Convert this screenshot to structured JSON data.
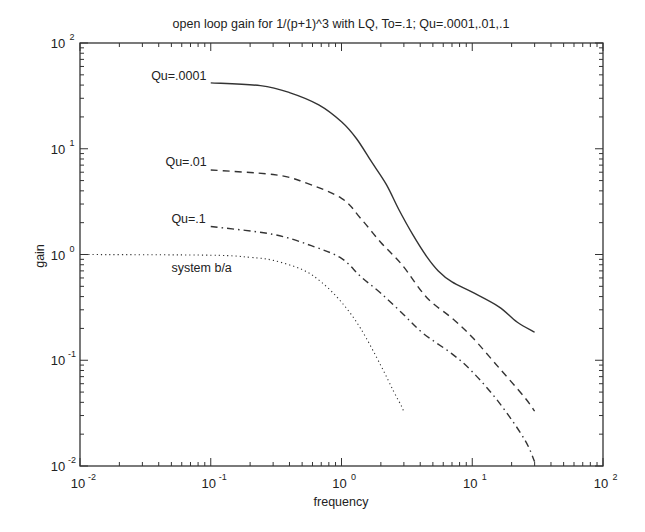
{
  "chart_data": {
    "type": "line",
    "title": "open loop gain for 1/(p+1)^3 with LQ, To=.1; Qu=.0001,.01,.1",
    "xlabel": "frequency",
    "ylabel": "gain",
    "xscale": "log",
    "yscale": "log",
    "xlim": [
      0.01,
      100
    ],
    "ylim": [
      0.01,
      100
    ],
    "grid": false,
    "x_ticks": [
      {
        "value": 0.01,
        "base": "10",
        "exp": "-2"
      },
      {
        "value": 0.1,
        "base": "10",
        "exp": "-1"
      },
      {
        "value": 1,
        "base": "10",
        "exp": "0"
      },
      {
        "value": 10,
        "base": "10",
        "exp": "1"
      },
      {
        "value": 100,
        "base": "10",
        "exp": "2"
      }
    ],
    "y_ticks": [
      {
        "value": 0.01,
        "base": "10",
        "exp": "-2"
      },
      {
        "value": 0.1,
        "base": "10",
        "exp": "-1"
      },
      {
        "value": 1,
        "base": "10",
        "exp": "0"
      },
      {
        "value": 10,
        "base": "10",
        "exp": "1"
      },
      {
        "value": 100,
        "base": "10",
        "exp": "2"
      }
    ],
    "series": [
      {
        "name": "Qu=.0001",
        "style": "solid",
        "label_at": {
          "x": 0.035,
          "y": 45
        },
        "points": [
          [
            0.1,
            42
          ],
          [
            0.24,
            39.5
          ],
          [
            0.4,
            34
          ],
          [
            0.67,
            26
          ],
          [
            1.0,
            18
          ],
          [
            1.3,
            12.5
          ],
          [
            1.7,
            7.5
          ],
          [
            2.2,
            4.6
          ],
          [
            2.75,
            2.65
          ],
          [
            3.5,
            1.55
          ],
          [
            4.5,
            0.95
          ],
          [
            5.5,
            0.7
          ],
          [
            7.0,
            0.55
          ],
          [
            10,
            0.44
          ],
          [
            16,
            0.32
          ],
          [
            22,
            0.23
          ],
          [
            30,
            0.184
          ]
        ]
      },
      {
        "name": "Qu=.01",
        "style": "dashed",
        "label_at": {
          "x": 0.045,
          "y": 6.8
        },
        "points": [
          [
            0.1,
            6.3
          ],
          [
            0.3,
            5.7
          ],
          [
            0.5,
            4.9
          ],
          [
            1.0,
            3.4
          ],
          [
            1.4,
            2.2
          ],
          [
            2.0,
            1.3
          ],
          [
            2.9,
            0.8
          ],
          [
            4.5,
            0.39
          ],
          [
            7.0,
            0.25
          ],
          [
            10,
            0.165
          ],
          [
            16,
            0.085
          ],
          [
            25,
            0.045
          ],
          [
            30,
            0.033
          ]
        ]
      },
      {
        "name": "Qu=.1",
        "style": "dashdot",
        "label_at": {
          "x": 0.05,
          "y": 2.0
        },
        "points": [
          [
            0.1,
            1.84
          ],
          [
            0.3,
            1.55
          ],
          [
            0.6,
            1.2
          ],
          [
            1.0,
            0.92
          ],
          [
            1.4,
            0.62
          ],
          [
            2.0,
            0.43
          ],
          [
            2.9,
            0.28
          ],
          [
            4.2,
            0.18
          ],
          [
            7.0,
            0.115
          ],
          [
            10,
            0.078
          ],
          [
            16,
            0.04
          ],
          [
            25,
            0.018
          ],
          [
            30,
            0.011
          ]
        ]
      },
      {
        "name": "system b/a",
        "style": "dotted",
        "label_at": {
          "x": 0.05,
          "y": 0.68
        },
        "points": [
          [
            0.01,
            1.0
          ],
          [
            0.1,
            0.985
          ],
          [
            0.2,
            0.94
          ],
          [
            0.3,
            0.88
          ],
          [
            0.5,
            0.72
          ],
          [
            0.7,
            0.55
          ],
          [
            1.0,
            0.354
          ],
          [
            1.4,
            0.2
          ],
          [
            2.0,
            0.089
          ],
          [
            2.5,
            0.051
          ],
          [
            2.9,
            0.036
          ],
          [
            3.0,
            0.0316
          ]
        ]
      }
    ]
  }
}
